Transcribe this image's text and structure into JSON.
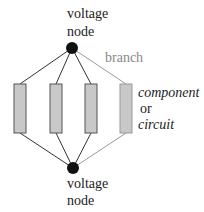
{
  "diagram": {
    "top_node": {
      "label_line1": "voltage",
      "label_line2": "node"
    },
    "bottom_node": {
      "label_line1": "voltage",
      "label_line2": "node"
    },
    "branch_label": "branch",
    "component_label": {
      "line1": "component",
      "line2": "or",
      "line3": "circuit"
    },
    "components_count": 4,
    "colors": {
      "node": "#111111",
      "wire": "#333333",
      "branch_wire": "#999999",
      "component_fill": "#c8c8c8",
      "component_stroke": "#555555",
      "branch_text": "#888888"
    }
  }
}
